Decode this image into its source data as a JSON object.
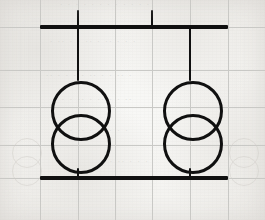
{
  "document": {
    "kind": "scanned-hand-drawn-schematic",
    "title": "Two-transformer single-line schematic on graph paper",
    "medium": "black ink on light gray graph paper",
    "width": 265,
    "height": 220
  },
  "colors": {
    "paper": "#f5f4f1",
    "grid_line": "#c9c9c6",
    "ink": "#101010",
    "bleed_through": "#d2cfca"
  },
  "grid": {
    "description": "light gray graph-paper ruling",
    "vertical_x": [
      40,
      78,
      115,
      152,
      190,
      228
    ],
    "horizontal_y": [
      27,
      70,
      107,
      145,
      178
    ],
    "spacing_px": 37.5
  },
  "schematic": {
    "top_busbar": {
      "label": "top busbar",
      "x1": 40,
      "x2": 228,
      "y": 27,
      "thickness": 3.4
    },
    "bottom_busbar": {
      "label": "bottom busbar",
      "x1": 40,
      "x2": 228,
      "y": 178,
      "thickness": 3.4
    },
    "top_tick": {
      "label": "short tap stub above busbar",
      "x": 152,
      "y1": 10,
      "y2": 27,
      "thickness": 2.6
    },
    "leads": [
      {
        "name": "left-upper-lead",
        "x": 78,
        "y1": 10,
        "y2": 81,
        "thickness": 2.6
      },
      {
        "name": "left-lower-lead",
        "x": 78,
        "y1": 168,
        "y2": 178,
        "thickness": 2.6
      },
      {
        "name": "right-upper-lead",
        "x": 190,
        "y1": 27,
        "y2": 81,
        "thickness": 2.6
      },
      {
        "name": "right-lower-lead",
        "x": 190,
        "y1": 168,
        "y2": 178,
        "thickness": 2.6
      }
    ],
    "transformers": [
      {
        "name": "left-transformer",
        "symbol": "two overlapping circles",
        "center_x": 78,
        "primary_coil": {
          "cx": 78,
          "cy": 108,
          "r": 27
        },
        "secondary_coil": {
          "cx": 78,
          "cy": 141,
          "r": 27
        }
      },
      {
        "name": "right-transformer",
        "symbol": "two overlapping circles",
        "center_x": 190,
        "primary_coil": {
          "cx": 190,
          "cy": 108,
          "r": 27
        },
        "secondary_coil": {
          "cx": 190,
          "cy": 141,
          "r": 27
        }
      }
    ]
  },
  "bleed_through": {
    "description": "faint mirrored ink showing through from the reverse side of the sheet",
    "symbols": [
      {
        "name": "bleed-transformer-bottom-left",
        "cx": 26,
        "cy_top": 152,
        "cy_bottom": 170,
        "r": 14
      },
      {
        "name": "bleed-transformer-bottom-right",
        "cx": 243,
        "cy_top": 152,
        "cy_bottom": 170,
        "r": 14
      }
    ],
    "text_rows": [
      {
        "name": "bleed-text-row-0",
        "x": 58,
        "y": 1,
        "text": "∙ ∙ ∙ ∙ ∙ ∙ ∙ ∙ ∙ ∙ ∙ ∙"
      },
      {
        "name": "bleed-text-row-1",
        "x": 48,
        "y": 38,
        "text": "∙ ∙ ∙  ∙∙ ∙ ∙∙ ∙ ∙  ∙∙ ∙"
      },
      {
        "name": "bleed-text-row-2",
        "x": 44,
        "y": 72,
        "text": "∙ ∙∙ ∙ ∙ ∙∙ ∙ ∙ ∙ ∙ ∙∙"
      },
      {
        "name": "bleed-text-row-3",
        "x": 52,
        "y": 96,
        "text": "∙∙ ∙ ∙ ∙∙ ∙ ∙∙ ∙ ∙ ∙"
      },
      {
        "name": "bleed-text-row-4",
        "x": 60,
        "y": 127,
        "text": "∙ ∙ ∙∙ ∙ ∙ ∙∙ ∙ ∙"
      },
      {
        "name": "bleed-text-row-5",
        "x": 100,
        "y": 158,
        "text": "∙ ∙ ∙ ∙∙ ∙ ∙"
      }
    ]
  }
}
